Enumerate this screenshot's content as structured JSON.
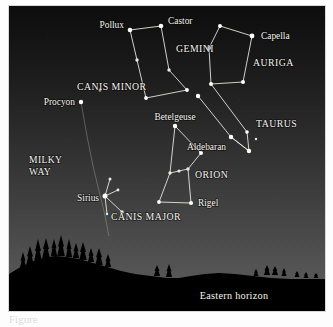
{
  "figure": {
    "horizon_label": "Eastern horizon",
    "caption_fragment": "Figure",
    "colors": {
      "sky_top": "#0d0d0d",
      "sky_horizon": "#5d5d5d",
      "star": "#ffffff",
      "constellation_line": "#efeee8",
      "label": "#f6f4ee",
      "ground": "#000000",
      "milky_way_line": "#b9b9b4"
    },
    "panel": {
      "x": 9,
      "y": 6,
      "width": 316,
      "height": 305
    }
  },
  "chart_data": {
    "type": "scatter",
    "xlabel": "",
    "ylabel": "",
    "xlim": [
      0,
      316
    ],
    "ylim": [
      0,
      305
    ],
    "grid": false,
    "legend": "none",
    "note": "Star chart: positions are plate pixel coordinates inside the sky panel; y increases downward.",
    "stars": [
      {
        "name": "Pollux",
        "x": 121,
        "y": 24,
        "r": 2.3,
        "labeled": true
      },
      {
        "name": "Castor",
        "x": 152,
        "y": 20,
        "r": 2.3,
        "labeled": true
      },
      {
        "name": "Gemini-3",
        "x": 128,
        "y": 54,
        "r": 1.7,
        "labeled": false
      },
      {
        "name": "Gemini-4",
        "x": 160,
        "y": 64,
        "r": 1.7,
        "labeled": false
      },
      {
        "name": "Gemini-5",
        "x": 178,
        "y": 84,
        "r": 1.9,
        "labeled": false
      },
      {
        "name": "Gemini-6",
        "x": 137,
        "y": 92,
        "r": 1.9,
        "labeled": false
      },
      {
        "name": "Capella",
        "x": 243,
        "y": 30,
        "r": 2.4,
        "labeled": true
      },
      {
        "name": "Auriga-2",
        "x": 211,
        "y": 20,
        "r": 2.0,
        "labeled": false
      },
      {
        "name": "Auriga-3",
        "x": 200,
        "y": 42,
        "r": 2.0,
        "labeled": false
      },
      {
        "name": "Auriga-4",
        "x": 202,
        "y": 78,
        "r": 2.0,
        "labeled": false
      },
      {
        "name": "Auriga-5",
        "x": 234,
        "y": 76,
        "r": 2.0,
        "labeled": false
      },
      {
        "name": "Aldebaran",
        "x": 222,
        "y": 131,
        "r": 2.2,
        "labeled": true
      },
      {
        "name": "Taurus-apex",
        "x": 240,
        "y": 145,
        "r": 2.2,
        "labeled": false
      },
      {
        "name": "Taurus-2",
        "x": 238,
        "y": 126,
        "r": 1.8,
        "labeled": false
      },
      {
        "name": "Taurus-3",
        "x": 247,
        "y": 133,
        "r": 1.2,
        "labeled": false
      },
      {
        "name": "Pleiades",
        "x": 189,
        "y": 90,
        "r": 2.2,
        "labeled": false
      },
      {
        "name": "Betelgeuse",
        "x": 166,
        "y": 120,
        "r": 2.2,
        "labeled": true
      },
      {
        "name": "Bellatrix",
        "x": 192,
        "y": 147,
        "r": 2.0,
        "labeled": false
      },
      {
        "name": "Belt-1",
        "x": 161,
        "y": 167,
        "r": 1.7,
        "labeled": false
      },
      {
        "name": "Belt-2",
        "x": 170,
        "y": 165,
        "r": 1.6,
        "labeled": false
      },
      {
        "name": "Belt-3",
        "x": 179,
        "y": 163,
        "r": 1.7,
        "labeled": false
      },
      {
        "name": "Saiph",
        "x": 150,
        "y": 196,
        "r": 1.9,
        "labeled": false
      },
      {
        "name": "Rigel",
        "x": 182,
        "y": 197,
        "r": 2.1,
        "labeled": true
      },
      {
        "name": "Procyon",
        "x": 72,
        "y": 96,
        "r": 2.2,
        "labeled": true
      },
      {
        "name": "Gomeisa",
        "x": 91,
        "y": 84,
        "r": 1.5,
        "labeled": false
      },
      {
        "name": "Sirius",
        "x": 96,
        "y": 190,
        "r": 2.5,
        "labeled": true
      },
      {
        "name": "CMa-2",
        "x": 101,
        "y": 173,
        "r": 1.5,
        "labeled": false
      },
      {
        "name": "CMa-3",
        "x": 109,
        "y": 184,
        "r": 1.4,
        "labeled": false
      },
      {
        "name": "CMa-4",
        "x": 113,
        "y": 206,
        "r": 1.7,
        "labeled": false
      },
      {
        "name": "CMa-5",
        "x": 98,
        "y": 208,
        "r": 1.2,
        "labeled": false
      }
    ],
    "constellation_lines": [
      {
        "name": "gemini",
        "points": [
          [
            121,
            24
          ],
          [
            152,
            20
          ],
          [
            160,
            64
          ],
          [
            178,
            84
          ],
          [
            137,
            92
          ],
          [
            128,
            54
          ],
          [
            121,
            24
          ]
        ]
      },
      {
        "name": "auriga",
        "points": [
          [
            211,
            20
          ],
          [
            243,
            30
          ],
          [
            234,
            76
          ],
          [
            202,
            78
          ],
          [
            200,
            42
          ],
          [
            211,
            20
          ]
        ]
      },
      {
        "name": "taurus",
        "points": [
          [
            189,
            90
          ],
          [
            222,
            131
          ],
          [
            240,
            145
          ],
          [
            238,
            126
          ],
          [
            202,
            78
          ]
        ]
      },
      {
        "name": "taurus-v",
        "points": [
          [
            222,
            131
          ],
          [
            240,
            145
          ]
        ]
      },
      {
        "name": "orion",
        "points": [
          [
            166,
            120
          ],
          [
            192,
            147
          ],
          [
            179,
            163
          ],
          [
            182,
            197
          ],
          [
            150,
            196
          ],
          [
            161,
            167
          ],
          [
            166,
            120
          ]
        ]
      },
      {
        "name": "orion-belt",
        "points": [
          [
            161,
            167
          ],
          [
            170,
            165
          ],
          [
            179,
            163
          ]
        ]
      },
      {
        "name": "canis-major",
        "points": [
          [
            101,
            173
          ],
          [
            96,
            190
          ],
          [
            113,
            206
          ]
        ]
      },
      {
        "name": "canis-major-2",
        "points": [
          [
            109,
            184
          ],
          [
            96,
            190
          ],
          [
            98,
            208
          ]
        ]
      }
    ],
    "milky_way_band": {
      "points": [
        [
          72,
          96
        ],
        [
          78,
          130
        ],
        [
          84,
          160
        ],
        [
          90,
          185
        ],
        [
          95,
          205
        ],
        [
          100,
          230
        ]
      ],
      "label": "MILKY\nWAY"
    }
  },
  "labels": {
    "stars": [
      {
        "text": "Pollux",
        "x": 115,
        "y": 22,
        "anchor": "end"
      },
      {
        "text": "Castor",
        "x": 159,
        "y": 18,
        "anchor": "start"
      },
      {
        "text": "Capella",
        "x": 252,
        "y": 33,
        "anchor": "start"
      },
      {
        "text": "Procyon",
        "x": 66,
        "y": 99,
        "anchor": "end"
      },
      {
        "text": "Betelgeuse",
        "x": 166,
        "y": 114,
        "anchor": "middle"
      },
      {
        "text": "Aldebaran",
        "x": 217,
        "y": 144,
        "anchor": "end"
      },
      {
        "text": "Rigel",
        "x": 189,
        "y": 200,
        "anchor": "start"
      },
      {
        "text": "Sirius",
        "x": 90,
        "y": 195,
        "anchor": "end"
      }
    ],
    "constellations": [
      {
        "text": "GEMINI",
        "x": 167,
        "y": 46,
        "anchor": "start"
      },
      {
        "text": "AURIGA",
        "x": 244,
        "y": 60,
        "anchor": "start"
      },
      {
        "text": "TAURUS",
        "x": 247,
        "y": 121,
        "anchor": "start"
      },
      {
        "text": "CANIS MINOR",
        "x": 68,
        "y": 84,
        "anchor": "start"
      },
      {
        "text": "ORION",
        "x": 186,
        "y": 172,
        "anchor": "start"
      },
      {
        "text": "CANIS MAJOR",
        "x": 102,
        "y": 214,
        "anchor": "start"
      }
    ],
    "milky_way": [
      {
        "text": "MILKY",
        "x": 20,
        "y": 157,
        "anchor": "start"
      },
      {
        "text": "WAY",
        "x": 20,
        "y": 169,
        "anchor": "start"
      }
    ],
    "horizon": {
      "text": "Eastern horizon",
      "x": 225,
      "y": 293,
      "anchor": "middle"
    }
  },
  "ground": {
    "skyline_path": "M0,268 L10,262 L22,256 L34,252 L46,250 L58,251 L70,253 L84,257 L98,261 L112,265 L126,268 L142,270 L158,272 L170,272 L182,270 L196,268 L210,267 L226,268 L244,270 L262,272 L282,273 L300,273 L316,273 L316,305 L0,305 Z",
    "trees": [
      {
        "x": 14,
        "base": 262,
        "h": 16,
        "w": 5
      },
      {
        "x": 21,
        "base": 259,
        "h": 19,
        "w": 6
      },
      {
        "x": 29,
        "base": 255,
        "h": 22,
        "w": 6
      },
      {
        "x": 37,
        "base": 252,
        "h": 20,
        "w": 6
      },
      {
        "x": 45,
        "base": 250,
        "h": 17,
        "w": 5
      },
      {
        "x": 52,
        "base": 250,
        "h": 21,
        "w": 6
      },
      {
        "x": 60,
        "base": 251,
        "h": 18,
        "w": 5
      },
      {
        "x": 67,
        "base": 252,
        "h": 15,
        "w": 5
      },
      {
        "x": 74,
        "base": 254,
        "h": 18,
        "w": 6
      },
      {
        "x": 82,
        "base": 256,
        "h": 14,
        "w": 5
      },
      {
        "x": 90,
        "base": 259,
        "h": 17,
        "w": 6
      },
      {
        "x": 99,
        "base": 261,
        "h": 13,
        "w": 5
      },
      {
        "x": 148,
        "base": 270,
        "h": 11,
        "w": 5
      },
      {
        "x": 160,
        "base": 271,
        "h": 13,
        "w": 5
      },
      {
        "x": 247,
        "base": 270,
        "h": 7,
        "w": 4
      },
      {
        "x": 258,
        "base": 269,
        "h": 10,
        "w": 5
      },
      {
        "x": 266,
        "base": 269,
        "h": 9,
        "w": 5
      },
      {
        "x": 275,
        "base": 270,
        "h": 8,
        "w": 4
      },
      {
        "x": 288,
        "base": 271,
        "h": 6,
        "w": 4
      },
      {
        "x": 297,
        "base": 272,
        "h": 6,
        "w": 4
      },
      {
        "x": 307,
        "base": 272,
        "h": 5,
        "w": 4
      }
    ]
  }
}
